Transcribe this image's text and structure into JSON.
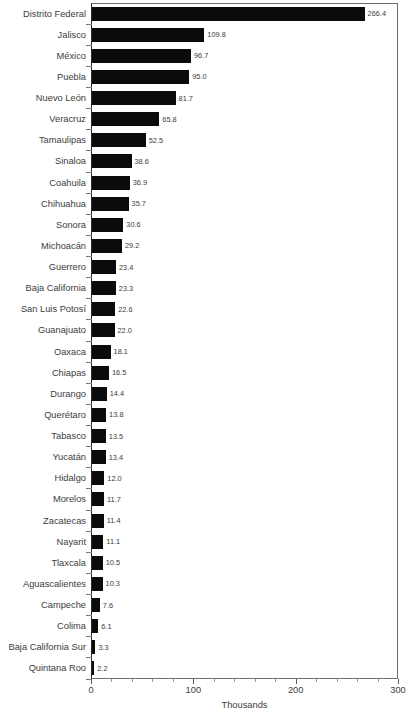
{
  "chart_data": {
    "type": "bar",
    "orientation": "horizontal",
    "title": "",
    "subtitle": "",
    "xlabel": "Thousands",
    "ylabel": "",
    "xlim": [
      0,
      300
    ],
    "xticks": [
      0,
      100,
      200,
      300
    ],
    "xtick_labels": [
      "0",
      "100",
      "200",
      "300"
    ],
    "minor_ticks_per_interval": 5,
    "grid": false,
    "legend": null,
    "bar_color": "#0b0b0b",
    "axis_color": "#6e6e6e",
    "text_color": "#3c3c3c",
    "show_value_labels": true,
    "categories": [
      "Distrito Federal",
      "Jalisco",
      "México",
      "Puebla",
      "Nuevo León",
      "Veracruz",
      "Tamaulipas",
      "Sinaloa",
      "Coahuila",
      "Chihuahua",
      "Sonora",
      "Michoacán",
      "Guerrero",
      "Baja California",
      "San Luis Potosí",
      "Guanajuato",
      "Oaxaca",
      "Chiapas",
      "Durango",
      "Querétaro",
      "Tabasco",
      "Yucatán",
      "Hidalgo",
      "Morelos",
      "Zacatecas",
      "Nayarit",
      "Tlaxcala",
      "Aguascalientes",
      "Campeche",
      "Colima",
      "Baja California Sur",
      "Quintana Roo"
    ],
    "values": [
      266.4,
      109.8,
      96.7,
      95.0,
      81.7,
      65.8,
      52.5,
      38.6,
      36.9,
      35.7,
      30.6,
      29.2,
      23.4,
      23.3,
      22.6,
      22.0,
      18.1,
      16.5,
      14.4,
      13.8,
      13.5,
      13.4,
      12.0,
      11.7,
      11.4,
      11.1,
      10.5,
      10.3,
      7.6,
      6.1,
      3.3,
      2.2
    ],
    "value_labels": [
      "266.4",
      "109.8",
      "96.7",
      "95.0",
      "81.7",
      "65.8",
      "52.5",
      "38.6",
      "36.9",
      "35.7",
      "30.6",
      "29.2",
      "23.4",
      "23.3",
      "22.6",
      "22.0",
      "18.1",
      "16.5",
      "14.4",
      "13.8",
      "13.5",
      "13.4",
      "12.0",
      "11.7",
      "11.4",
      "11.1",
      "10.5",
      "10.3",
      "7.6",
      "6.1",
      "3.3",
      "2.2"
    ]
  }
}
